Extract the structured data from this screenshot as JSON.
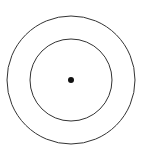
{
  "diagram": {
    "type": "concentric-circles",
    "background": "#ffffff",
    "stroke_color": "#333333",
    "center": {
      "x": 71,
      "y": 80
    },
    "outer_circle": {
      "radius": 64
    },
    "inner_circle": {
      "radius": 41
    },
    "center_dot": {
      "radius": 3,
      "fill": "#111111"
    }
  }
}
